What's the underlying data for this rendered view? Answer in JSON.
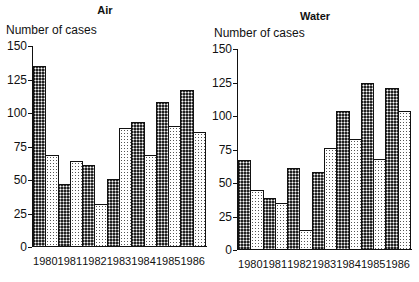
{
  "chart_data": [
    {
      "type": "bar",
      "title": "Air",
      "ylabel": "Number of cases",
      "xlabel": "",
      "categories": [
        "1980",
        "1981",
        "1982",
        "1983",
        "1984",
        "1985",
        "1986"
      ],
      "series": [
        {
          "name": "Series 1 (dark)",
          "values": [
            135,
            47,
            61,
            51,
            93,
            108,
            117
          ]
        },
        {
          "name": "Series 2 (light)",
          "values": [
            69,
            64,
            32,
            89,
            69,
            90,
            86
          ]
        }
      ],
      "yticks": [
        0,
        25,
        50,
        75,
        100,
        125,
        150
      ],
      "ylim": [
        0,
        150
      ],
      "grid": false,
      "legend": "none"
    },
    {
      "type": "bar",
      "title": "Water",
      "ylabel": "Number of cases",
      "xlabel": "",
      "categories": [
        "1980",
        "1981",
        "1982",
        "1983",
        "1984",
        "1985",
        "1986"
      ],
      "series": [
        {
          "name": "Series 1 (dark)",
          "values": [
            67,
            39,
            61,
            58,
            104,
            125,
            121
          ]
        },
        {
          "name": "Series 2 (light)",
          "values": [
            45,
            35,
            15,
            76,
            83,
            68,
            104
          ]
        }
      ],
      "yticks": [
        0,
        25,
        50,
        75,
        100,
        125,
        150
      ],
      "ylim": [
        0,
        150
      ],
      "grid": false,
      "legend": "none"
    }
  ],
  "panels": [
    {
      "title": "Air",
      "ylabel": "Number of cases"
    },
    {
      "title": "Water",
      "ylabel": "Number of cases"
    }
  ]
}
